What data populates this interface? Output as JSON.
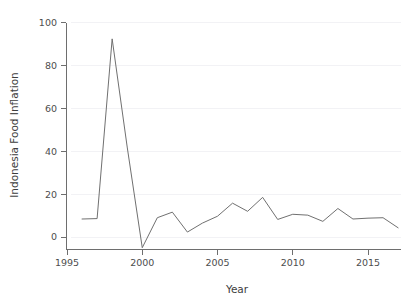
{
  "chart_data": {
    "type": "line",
    "title": "",
    "xlabel": "Year",
    "ylabel": "Indonesia Food Inflation",
    "xlim": [
      1995.2,
      2017.2
    ],
    "ylim": [
      -6,
      102
    ],
    "grid": true,
    "legend": null,
    "x_ticks": [
      1995,
      2000,
      2005,
      2010,
      2015
    ],
    "x_tick_labels": [
      "1995",
      "2000",
      "2005",
      "2010",
      "2015"
    ],
    "y_ticks": [
      0,
      20,
      40,
      60,
      80,
      100
    ],
    "y_tick_labels": [
      "0",
      "20",
      "40",
      "60",
      "80",
      "100"
    ],
    "series": [
      {
        "name": "Indonesia Food Inflation",
        "color": "#707070",
        "x": [
          1996,
          1997,
          1998,
          1999,
          2000,
          2001,
          2002,
          2003,
          2004,
          2005,
          2006,
          2007,
          2008,
          2009,
          2010,
          2011,
          2012,
          2013,
          2014,
          2015,
          2016,
          2017
        ],
        "values": [
          8.4,
          8.6,
          92.5,
          42.0,
          -5.0,
          9.0,
          11.6,
          2.3,
          6.5,
          9.7,
          15.8,
          12.0,
          18.5,
          8.2,
          10.6,
          10.2,
          7.3,
          13.3,
          8.4,
          8.8,
          9.0,
          4.3
        ]
      }
    ]
  },
  "axis": {
    "x_title": "Year",
    "y_title": "Indonesia Food Inflation"
  },
  "colors": {
    "line": "#707070",
    "axis": "#6e6e6e",
    "grid": "#f2f2f5",
    "text": "#4d4d4d",
    "background": "#ffffff"
  }
}
